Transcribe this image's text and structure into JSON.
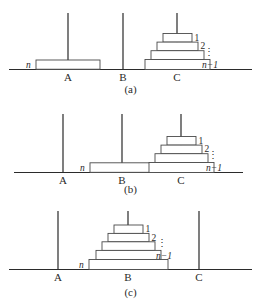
{
  "figure": {
    "peg_labels": [
      "A",
      "B",
      "C"
    ],
    "colors": {
      "background": "#ffffff",
      "line": "#2b2b2b",
      "peg": "#3a3a3a",
      "disk_stroke": "#4a4a4a",
      "disk_fill": "#ffffff",
      "text": "#2a2a2a"
    },
    "disk_labels": {
      "one": "1",
      "two": "2",
      "vdots": "⋮",
      "n_minus_1": "n−1",
      "n": "n"
    }
  },
  "panels": [
    {
      "id": "a",
      "caption": "(a)",
      "pegs": [
        {
          "label": "A",
          "cx": 68,
          "disks": [
            "n"
          ]
        },
        {
          "label": "B",
          "cx": 123,
          "disks": []
        },
        {
          "label": "C",
          "cx": 177,
          "disks": [
            "1",
            "2",
            "⋮",
            "n−1"
          ]
        }
      ]
    },
    {
      "id": "b",
      "caption": "(b)",
      "pegs": [
        {
          "label": "A",
          "cx": 63,
          "disks": []
        },
        {
          "label": "B",
          "cx": 122,
          "disks": [
            "n"
          ]
        },
        {
          "label": "C",
          "cx": 181,
          "disks": [
            "1",
            "2",
            "⋮",
            "n−1"
          ]
        }
      ]
    },
    {
      "id": "c",
      "caption": "(c)",
      "pegs": [
        {
          "label": "A",
          "cx": 58,
          "disks": []
        },
        {
          "label": "B",
          "cx": 128,
          "disks": [
            "1",
            "2",
            "⋮",
            "n−1",
            "n"
          ]
        },
        {
          "label": "C",
          "cx": 199,
          "disks": []
        }
      ]
    }
  ]
}
